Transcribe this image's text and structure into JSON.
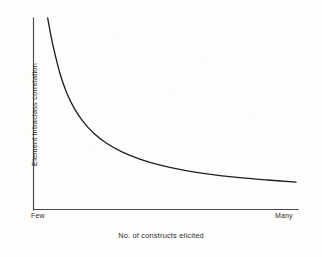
{
  "figure": {
    "background_color": "#fdfdfc",
    "axis_color": "#4a4a4a",
    "curve_color": "#1f1f1f"
  },
  "chart_data": {
    "type": "line",
    "title": "",
    "subtitle": "",
    "xlabel": "No. of constructs elicited",
    "ylabel": "Element intraclass correlation",
    "xtick_labels": [
      "Few",
      "Many"
    ],
    "ytick_labels": [],
    "grid": false,
    "legend": null,
    "annotations": [],
    "xlim": [
      0,
      1
    ],
    "ylim": [
      0,
      1
    ],
    "series": [
      {
        "name": "Element intraclass correlation",
        "description": "Monotonically decreasing hyperbolic decay curve; very steep near the left axis, flattening to a near-horizontal asymptote at the right.",
        "x": [
          0.03,
          0.045,
          0.06,
          0.08,
          0.105,
          0.135,
          0.17,
          0.21,
          0.26,
          0.32,
          0.39,
          0.47,
          0.56,
          0.66,
          0.77,
          0.89,
          1.0
        ],
        "y": [
          1.0,
          0.885,
          0.79,
          0.68,
          0.58,
          0.492,
          0.418,
          0.356,
          0.3,
          0.252,
          0.212,
          0.178,
          0.15,
          0.128,
          0.11,
          0.095,
          0.083
        ]
      }
    ]
  },
  "axes": {
    "x_tick_low": "Few",
    "x_tick_high": "Many",
    "x_title": "No. of constructs elicited",
    "y_title": "Element intraclass correlation"
  }
}
